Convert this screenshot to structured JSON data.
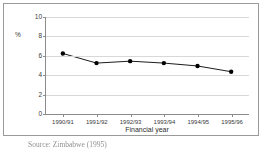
{
  "chart_data": {
    "type": "line",
    "title": "",
    "subtitle": "",
    "xlabel": "Financial year",
    "ylabel": "%",
    "categories": [
      "1990/91",
      "1991/92",
      "1992/93",
      "1993/94",
      "1994/95",
      "1995/96"
    ],
    "values": [
      6.2,
      5.2,
      5.4,
      5.2,
      4.9,
      4.3
    ],
    "series": [
      {
        "name": "",
        "values": [
          6.2,
          5.2,
          5.4,
          5.2,
          4.9,
          4.3
        ]
      }
    ],
    "ylim": [
      0,
      10
    ],
    "yticks": [
      0,
      2,
      4,
      6,
      8,
      10
    ],
    "ytick_labels": [
      "0",
      "2",
      "4",
      "6",
      "8",
      "10"
    ],
    "grid": true,
    "grid_axis": "y",
    "legend": false,
    "legend_position": "none",
    "marker": "filled-circle",
    "line_color": "#1a1a1a",
    "marker_color": "#000000",
    "grid_color": "#d8d8d8",
    "axis_color": "#8c8c8c"
  },
  "figure": {
    "source_note": "Source: Zimbabwe (1995)",
    "frame_color": "#9a9a9a",
    "background": "#ffffff"
  }
}
